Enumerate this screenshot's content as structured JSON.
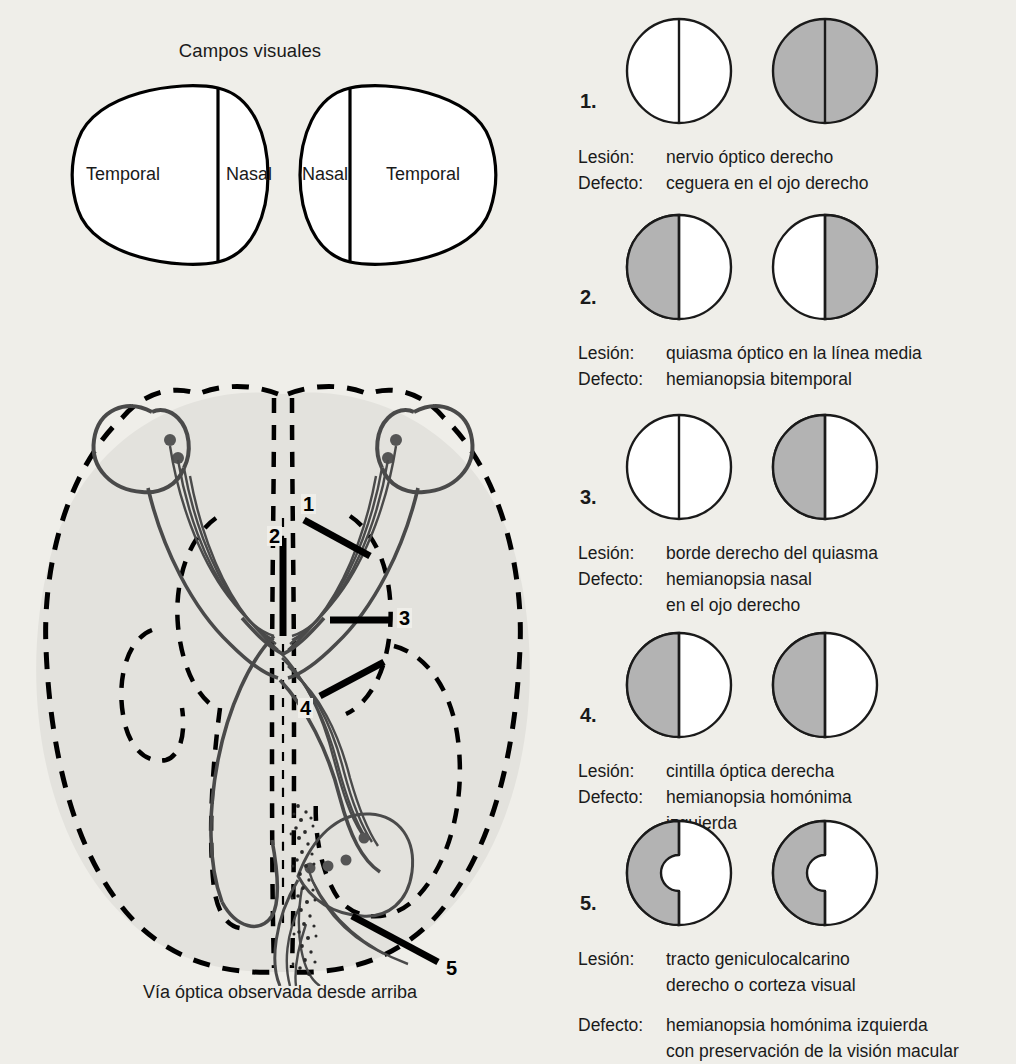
{
  "colors": {
    "page_background": "#efeee9",
    "ink": "#1a1a1a",
    "deficit_gray": "#b3b3b3",
    "brain_fill": "#e3e2dd",
    "outline": "#000000"
  },
  "visual_fields": {
    "title": "Campos visuales",
    "left_eye": {
      "outer_label": "Temporal",
      "inner_label": "Nasal"
    },
    "right_eye": {
      "inner_label": "Nasal",
      "outer_label": "Temporal"
    }
  },
  "brain_diagram": {
    "caption": "Vía óptica observada desde arriba",
    "lesion_markers": [
      "1",
      "2",
      "3",
      "4",
      "5"
    ]
  },
  "cases": [
    {
      "number": "1.",
      "lesion_key": "Lesión:",
      "lesion_value": "nervio óptico derecho",
      "defect_key": "Defecto:",
      "defect_value": "ceguera en el ojo derecho",
      "defect_value_2": "",
      "left_eye": {
        "left_half": "clear",
        "right_half": "clear",
        "macular_sparing": false
      },
      "right_eye": {
        "left_half": "shaded",
        "right_half": "shaded",
        "macular_sparing": false
      }
    },
    {
      "number": "2.",
      "lesion_key": "Lesión:",
      "lesion_value": "quiasma óptico en la línea media",
      "defect_key": "Defecto:",
      "defect_value": "hemianopsia bitemporal",
      "defect_value_2": "",
      "left_eye": {
        "left_half": "shaded",
        "right_half": "clear",
        "macular_sparing": false
      },
      "right_eye": {
        "left_half": "clear",
        "right_half": "shaded",
        "macular_sparing": false
      }
    },
    {
      "number": "3.",
      "lesion_key": "Lesión:",
      "lesion_value": "borde derecho del quiasma",
      "defect_key": "Defecto:",
      "defect_value": "hemianopsia nasal",
      "defect_value_2": "en el ojo derecho",
      "left_eye": {
        "left_half": "clear",
        "right_half": "clear",
        "macular_sparing": false
      },
      "right_eye": {
        "left_half": "shaded",
        "right_half": "clear",
        "macular_sparing": false
      }
    },
    {
      "number": "4.",
      "lesion_key": "Lesión:",
      "lesion_value": "cintilla óptica derecha",
      "defect_key": "Defecto:",
      "defect_value": "hemianopsia homónima",
      "defect_value_2": "izquierda",
      "left_eye": {
        "left_half": "shaded",
        "right_half": "clear",
        "macular_sparing": false
      },
      "right_eye": {
        "left_half": "shaded",
        "right_half": "clear",
        "macular_sparing": false
      }
    },
    {
      "number": "5.",
      "lesion_key": "Lesión:",
      "lesion_value": "tracto geniculocalcarino",
      "lesion_value_2": "derecho o corteza visual",
      "defect_key": "Defecto:",
      "defect_value": "hemianopsia homónima izquierda",
      "defect_value_2": "con preservación de la visión macular",
      "left_eye": {
        "left_half": "shaded",
        "right_half": "clear",
        "macular_sparing": true
      },
      "right_eye": {
        "left_half": "shaded",
        "right_half": "clear",
        "macular_sparing": true
      }
    }
  ]
}
